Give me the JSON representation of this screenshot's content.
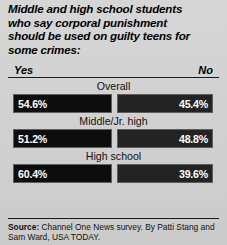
{
  "title": {
    "lines": [
      "Middle and high school students",
      "who say corporal punishment",
      "should be used on guilty teens for",
      "some crimes:"
    ]
  },
  "legend": {
    "yes": "Yes",
    "no": "No"
  },
  "footer": {
    "label": "Source:",
    "text": "Channel One News survey. By Patti Stang and Sam Ward, USA TODAY."
  },
  "colors": {
    "background": "#d2d2d2",
    "bar_yes": "#0d0d0d",
    "bar_no": "#232323",
    "bar_border": "#5e5e5e",
    "value_text": "#ffffff",
    "rule": "#1a1a1a"
  },
  "chart_data": {
    "type": "bar",
    "title": "Middle and high school students who say corporal punishment should be used on guilty teens for some crimes:",
    "xlabel": "",
    "ylabel": "",
    "categories": [
      "Overall",
      "Middle/Jr. high",
      "High school"
    ],
    "series": [
      {
        "name": "Yes",
        "values": [
          54.6,
          51.2,
          60.4
        ],
        "labels": [
          "54.6%",
          "51.2%",
          "60.4%"
        ]
      },
      {
        "name": "No",
        "values": [
          45.4,
          48.8,
          39.6
        ],
        "labels": [
          "45.4%",
          "48.8%",
          "39.6%"
        ]
      }
    ],
    "units": "percent",
    "ylim": [
      0,
      100
    ],
    "grid": false,
    "legend_position": "top",
    "orientation": "horizontal",
    "note": "Paired horizontal bars of fixed equal width; values shown as labels rather than proportional lengths."
  },
  "rows": [
    {
      "label": "Overall",
      "yes_value": "54.6%",
      "no_value": "45.4%"
    },
    {
      "label": "Middle/Jr. high",
      "yes_value": "51.2%",
      "no_value": "48.8%"
    },
    {
      "label": "High school",
      "yes_value": "60.4%",
      "no_value": "39.6%"
    }
  ]
}
